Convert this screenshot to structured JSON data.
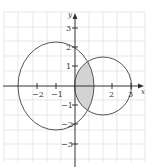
{
  "diagram": {
    "type": "coordinate-plane-circles",
    "axes": {
      "x_label": "x",
      "y_label": "y",
      "x_ticks": [
        {
          "value": -2,
          "label": "−2"
        },
        {
          "value": -1,
          "label": "−1"
        },
        {
          "value": 2,
          "label": "2"
        },
        {
          "value": 3,
          "label": "3"
        }
      ],
      "y_ticks": [
        {
          "value": 3,
          "label": "3"
        },
        {
          "value": 2,
          "label": "2"
        },
        {
          "value": 1,
          "label": "1"
        },
        {
          "value": -1,
          "label": "−1"
        },
        {
          "value": -2,
          "label": "−2"
        },
        {
          "value": -3,
          "label": "−3"
        }
      ]
    },
    "shapes": [
      {
        "name": "large-circle",
        "center": [
          -1,
          0
        ],
        "radius": 2.1
      },
      {
        "name": "small-circle",
        "center": [
          1.5,
          0
        ],
        "radius": 1.5
      }
    ],
    "shaded_region": "intersection of the two circles",
    "colors": {
      "grid": "#d9d9d9",
      "axes": "#333333",
      "curves": "#555555",
      "shade": "#d3d3d3",
      "background": "#ffffff"
    }
  }
}
